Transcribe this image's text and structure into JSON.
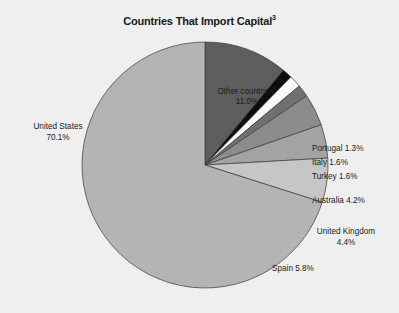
{
  "chart_data": {
    "type": "pie",
    "title": "Countries That Import Capital",
    "title_footnote": "3",
    "xlabel": "",
    "ylabel": "",
    "legend_position": "none",
    "grid": false,
    "unit": "%",
    "categories": [
      "United States",
      "Other countries",
      "Portugal",
      "Italy",
      "Turkey",
      "Australia",
      "United Kingdom",
      "Spain"
    ],
    "values": [
      70.1,
      11.0,
      1.3,
      1.6,
      1.6,
      4.2,
      4.4,
      5.8
    ],
    "slices": [
      {
        "name": "United States",
        "label": "United States",
        "value": 70.1,
        "value_text": "70.1%",
        "footnote": "",
        "color": "#b4b4b4",
        "label_align": "center"
      },
      {
        "name": "Other countries",
        "label": "Other countries",
        "value": 11.0,
        "value_text": "11.0%",
        "footnote": "4",
        "color": "#5d5d5d",
        "label_align": "center"
      },
      {
        "name": "Portugal",
        "label": "Portugal 1.3%",
        "value": 1.3,
        "value_text": "1.3%",
        "footnote": "",
        "color": "#0d0d0d",
        "label_align": "left"
      },
      {
        "name": "Italy",
        "label": "Italy 1.6%",
        "value": 1.6,
        "value_text": "1.6%",
        "footnote": "",
        "color": "#fbfbfb",
        "label_align": "left"
      },
      {
        "name": "Turkey",
        "label": "Turkey 1.6%",
        "value": 1.6,
        "value_text": "1.6%",
        "footnote": "",
        "color": "#707070",
        "label_align": "left"
      },
      {
        "name": "Australia",
        "label": "Australia 4.2%",
        "value": 4.2,
        "value_text": "4.2%",
        "footnote": "",
        "color": "#8c8c8c",
        "label_align": "left"
      },
      {
        "name": "United Kingdom",
        "label": "United Kingdom",
        "value": 4.4,
        "value_text": "4.4%",
        "footnote": "",
        "color": "#a3a3a3",
        "label_align": "center"
      },
      {
        "name": "Spain",
        "label": "Spain 5.8%",
        "value": 5.8,
        "value_text": "5.8%",
        "footnote": "",
        "color": "#c6c6c6",
        "label_align": "left"
      }
    ],
    "background_color": "#efefef",
    "outline_color": "#3a3a3a",
    "text_color": "#1c1c1c"
  },
  "labels": {
    "united_states": {
      "name": "United States",
      "value": "70.1%"
    },
    "other_countries": {
      "name": "Other countries",
      "footnote": "4",
      "value": "11.0%"
    },
    "portugal": {
      "text": "Portugal 1.3%"
    },
    "italy": {
      "text": "Italy 1.6%"
    },
    "turkey": {
      "text": "Turkey 1.6%"
    },
    "australia": {
      "text": "Australia 4.2%"
    },
    "united_kingdom": {
      "name": "United Kingdom",
      "value": "4.4%"
    },
    "spain": {
      "text": "Spain 5.8%"
    }
  },
  "title": {
    "text": "Countries That Import Capital",
    "footnote": "3"
  }
}
